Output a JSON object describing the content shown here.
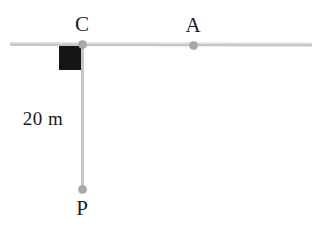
{
  "figure": {
    "name": "pendulum-on-horizontal-track",
    "width": 327,
    "height": 227,
    "background_color": "#ffffff"
  },
  "colors": {
    "line": "#c6c6c6",
    "line_light": "#d4d4d4",
    "node": "#a9a9a9",
    "node_stroke": "#9a9a9a",
    "block": "#151515",
    "text": "#1c1c1c"
  },
  "labels": {
    "c": "C",
    "a": "A",
    "p": "P",
    "length": "20 m"
  },
  "geometry": {
    "horizontal_line": {
      "x1": 10,
      "y1": 44,
      "x2": 312,
      "y2": 45,
      "width": 3
    },
    "vertical_line": {
      "x1": 82,
      "y1": 44,
      "x2": 82,
      "y2": 189,
      "width": 3
    },
    "block": {
      "x": 59,
      "y": 46,
      "width": 22,
      "height": 24
    },
    "nodes": [
      {
        "id": "C",
        "cx": 82,
        "cy": 44,
        "r": 4
      },
      {
        "id": "A",
        "cx": 193,
        "cy": 45,
        "r": 4
      },
      {
        "id": "P",
        "cx": 82,
        "cy": 189,
        "r": 4
      }
    ]
  },
  "chart_data": {
    "type": "diagram",
    "title": "",
    "points": [
      {
        "label": "C",
        "x": 82,
        "y": 44,
        "on": "horizontal-track"
      },
      {
        "label": "A",
        "x": 193,
        "y": 45,
        "on": "horizontal-track"
      },
      {
        "label": "P",
        "x": 82,
        "y": 189,
        "on": "string-end"
      }
    ],
    "segments": [
      {
        "name": "horizontal-track",
        "from": [
          10,
          44
        ],
        "to": [
          312,
          45
        ]
      },
      {
        "name": "string-CP",
        "from": [
          82,
          44
        ],
        "to": [
          82,
          189
        ],
        "length_label": "20 m"
      }
    ],
    "annotations": [
      {
        "text": "20 m",
        "x": 43,
        "y": 119,
        "refers_to": "string-CP"
      }
    ]
  }
}
